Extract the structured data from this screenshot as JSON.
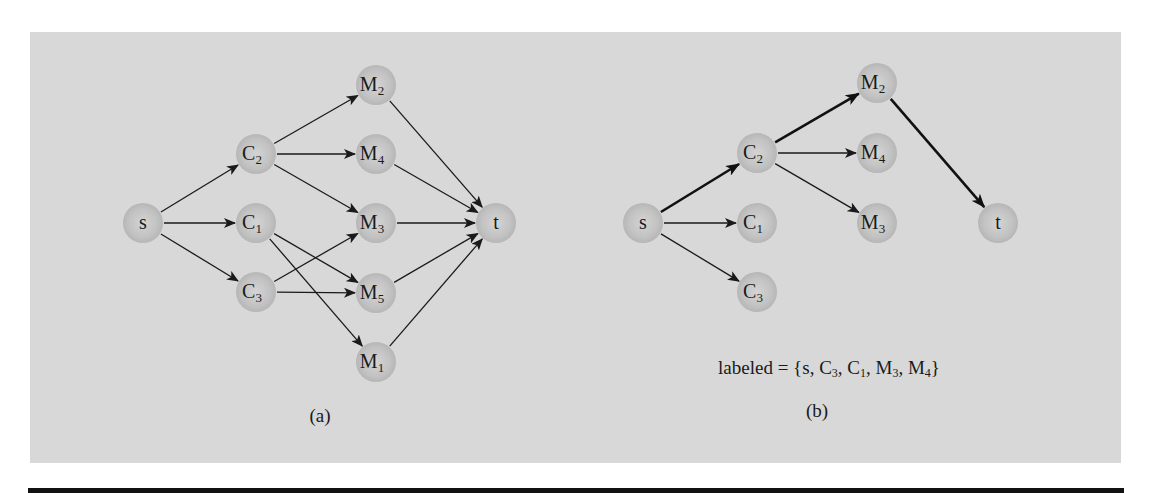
{
  "figure": {
    "panel_color": "#d8d8d8",
    "node_color": "#bdbdbd",
    "edge_color": "#1a1a1a"
  },
  "diagram_a": {
    "caption": "(a)",
    "nodes": [
      {
        "id": "s",
        "label": "s",
        "sub": "",
        "x": 143,
        "y": 223
      },
      {
        "id": "C2",
        "label": "C",
        "sub": "2",
        "x": 256,
        "y": 154
      },
      {
        "id": "C1",
        "label": "C",
        "sub": "1",
        "x": 256,
        "y": 223
      },
      {
        "id": "C3",
        "label": "C",
        "sub": "3",
        "x": 256,
        "y": 292
      },
      {
        "id": "M2",
        "label": "M",
        "sub": "2",
        "x": 376,
        "y": 85
      },
      {
        "id": "M4",
        "label": "M",
        "sub": "4",
        "x": 376,
        "y": 154
      },
      {
        "id": "M3",
        "label": "M",
        "sub": "3",
        "x": 376,
        "y": 223
      },
      {
        "id": "M5",
        "label": "M",
        "sub": "5",
        "x": 376,
        "y": 293
      },
      {
        "id": "M1",
        "label": "M",
        "sub": "1",
        "x": 376,
        "y": 362
      },
      {
        "id": "t",
        "label": "t",
        "sub": "",
        "x": 496,
        "y": 223
      }
    ],
    "edges": [
      {
        "from": "s",
        "to": "C2",
        "bold": false
      },
      {
        "from": "s",
        "to": "C1",
        "bold": false
      },
      {
        "from": "s",
        "to": "C3",
        "bold": false
      },
      {
        "from": "C2",
        "to": "M2",
        "bold": false
      },
      {
        "from": "C2",
        "to": "M4",
        "bold": false
      },
      {
        "from": "C2",
        "to": "M3",
        "bold": false
      },
      {
        "from": "C1",
        "to": "M5",
        "bold": false
      },
      {
        "from": "C1",
        "to": "M1",
        "bold": false
      },
      {
        "from": "C3",
        "to": "M3",
        "bold": false
      },
      {
        "from": "C3",
        "to": "M5",
        "bold": false
      },
      {
        "from": "M2",
        "to": "t",
        "bold": false
      },
      {
        "from": "M4",
        "to": "t",
        "bold": false
      },
      {
        "from": "M3",
        "to": "t",
        "bold": false
      },
      {
        "from": "M5",
        "to": "t",
        "bold": false
      },
      {
        "from": "M1",
        "to": "t",
        "bold": false
      }
    ]
  },
  "diagram_b": {
    "caption": "(b)",
    "labeled_text": {
      "prefix": "labeled = {s, ",
      "items": [
        {
          "label": "C",
          "sub": "3"
        },
        {
          "label": "C",
          "sub": "1"
        },
        {
          "label": "M",
          "sub": "3"
        },
        {
          "label": "M",
          "sub": "4"
        }
      ],
      "suffix": "}"
    },
    "nodes": [
      {
        "id": "s",
        "label": "s",
        "sub": "",
        "x": 643,
        "y": 223
      },
      {
        "id": "C2",
        "label": "C",
        "sub": "2",
        "x": 757,
        "y": 153
      },
      {
        "id": "C1",
        "label": "C",
        "sub": "1",
        "x": 757,
        "y": 223
      },
      {
        "id": "C3",
        "label": "C",
        "sub": "3",
        "x": 757,
        "y": 292
      },
      {
        "id": "M2",
        "label": "M",
        "sub": "2",
        "x": 877,
        "y": 83
      },
      {
        "id": "M4",
        "label": "M",
        "sub": "4",
        "x": 877,
        "y": 153
      },
      {
        "id": "M3",
        "label": "M",
        "sub": "3",
        "x": 877,
        "y": 223
      },
      {
        "id": "t",
        "label": "t",
        "sub": "",
        "x": 998,
        "y": 223
      }
    ],
    "edges": [
      {
        "from": "s",
        "to": "C2",
        "bold": true
      },
      {
        "from": "s",
        "to": "C1",
        "bold": false
      },
      {
        "from": "s",
        "to": "C3",
        "bold": false
      },
      {
        "from": "C2",
        "to": "M2",
        "bold": true
      },
      {
        "from": "C2",
        "to": "M4",
        "bold": false
      },
      {
        "from": "C2",
        "to": "M3",
        "bold": false
      },
      {
        "from": "M2",
        "to": "t",
        "bold": true
      }
    ]
  }
}
